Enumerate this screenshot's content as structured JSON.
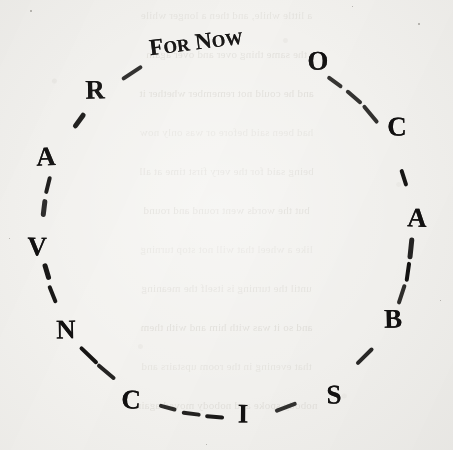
{
  "page": {
    "kind": "scanned-book-page",
    "paper_color": "#f3f2ef",
    "ink_color": "#111010",
    "showthrough_color": "#b9b5ac"
  },
  "figure": {
    "name": "dashed-circle-of-letters",
    "center_x": 227,
    "center_y": 232,
    "radius": 185,
    "phrase": {
      "full": "For Now",
      "lead_cap_1": "F",
      "small_1": "OR",
      "lead_cap_2": "N",
      "small_2": "OW",
      "x": 196,
      "y": 42
    },
    "letters": [
      {
        "char": "O",
        "x": 318,
        "y": 61,
        "angle_deg": -60
      },
      {
        "char": "C",
        "x": 397,
        "y": 127,
        "angle_deg": -30
      },
      {
        "char": "A",
        "x": 417,
        "y": 218,
        "angle_deg": -4
      },
      {
        "char": "B",
        "x": 393,
        "y": 319,
        "angle_deg": 28
      },
      {
        "char": "S",
        "x": 334,
        "y": 395,
        "angle_deg": 55
      },
      {
        "char": "I",
        "x": 243,
        "y": 414,
        "angle_deg": 84
      },
      {
        "char": "C",
        "x": 131,
        "y": 400,
        "angle_deg": 122
      },
      {
        "char": "N",
        "x": 66,
        "y": 330,
        "angle_deg": 152
      },
      {
        "char": "V",
        "x": 37,
        "y": 247,
        "angle_deg": 176
      },
      {
        "char": "A",
        "x": 46,
        "y": 157,
        "angle_deg": 205
      },
      {
        "char": "R",
        "x": 95,
        "y": 90,
        "angle_deg": 233
      }
    ],
    "reading_clockwise": "For Now - O C A B S I C N V A R",
    "reading_counterclockwise": "For Now - R A V N C I S B A C O"
  },
  "showthrough_lines": [
    "a little while, and then a longer while",
    "the same thing over and over again",
    "and he could not remember whether it",
    "had been said before or was only now",
    "being said for the very first time at all",
    "but the words went round and round",
    "like a wheel that will not stop turning",
    "until the turning is itself the meaning",
    "and so it was with him and with them",
    "that evening in the room upstairs and",
    "nobody spoke and nobody moved again"
  ],
  "specks": [
    {
      "x": 30,
      "y": 10,
      "d": 2
    },
    {
      "x": 418,
      "y": 23,
      "d": 2
    },
    {
      "x": 9,
      "y": 238,
      "d": 1
    },
    {
      "x": 440,
      "y": 300,
      "d": 1
    },
    {
      "x": 206,
      "y": 444,
      "d": 1
    },
    {
      "x": 352,
      "y": 6,
      "d": 1
    }
  ]
}
